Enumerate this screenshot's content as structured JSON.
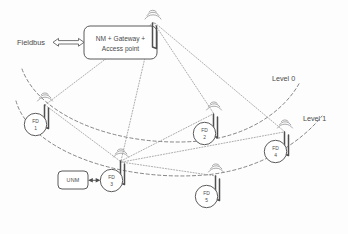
{
  "diagram": {
    "background_color": "#fdfdfd",
    "line_color": "#585858",
    "dash_color": "#707070",
    "dot_color": "#8a8a8a"
  },
  "labels": {
    "fieldbus": "Fieldbus",
    "level_0": "Level 0",
    "level_1": "Level 1"
  },
  "gateway": {
    "line_1": "NM + Gateway +",
    "line_2": "Access point",
    "icon": "antenna-icon"
  },
  "unm": {
    "label": "UNM"
  },
  "nodes": [
    {
      "id": "fd1",
      "prefix": "FD",
      "number": "1"
    },
    {
      "id": "fd2",
      "prefix": "FD",
      "number": "2"
    },
    {
      "id": "fd3",
      "prefix": "FD",
      "number": "3"
    },
    {
      "id": "fd4",
      "prefix": "FD",
      "number": "4"
    },
    {
      "id": "fd5",
      "prefix": "FD",
      "number": "5"
    }
  ]
}
